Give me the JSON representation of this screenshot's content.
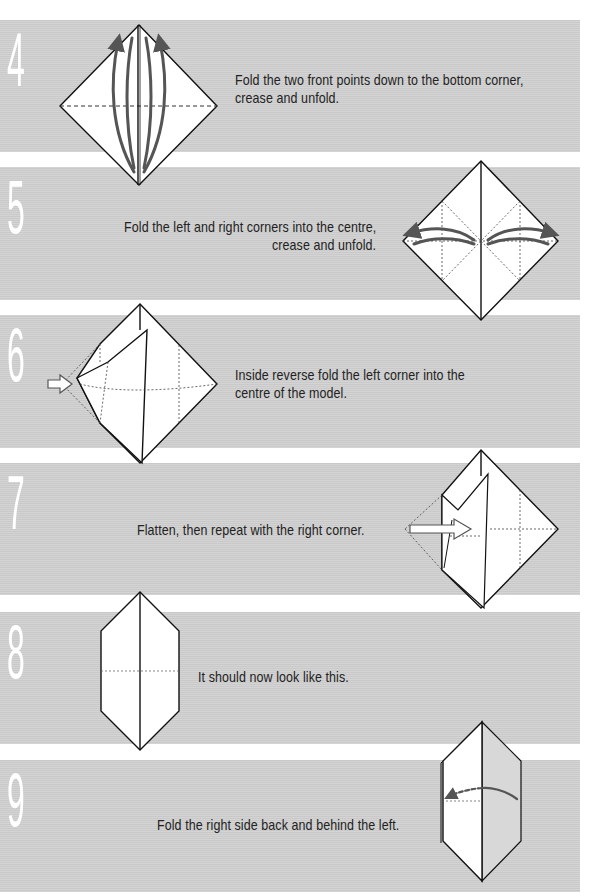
{
  "colors": {
    "band": "#cfcfcf",
    "numeral": "#ffffff",
    "text": "#222222",
    "arrow": "#555555",
    "paper": "#ffffff",
    "line": "#111111"
  },
  "steps": [
    {
      "number": "4",
      "text_lines": [
        "Fold the two front points down to the bottom corner,",
        "crease and unfold."
      ],
      "diagram": "square-base-diamond-with-curved-arrows"
    },
    {
      "number": "5",
      "text_lines": [
        "Fold the left and right corners into the centre,",
        "crease and unfold."
      ],
      "diagram": "diamond-with-side-corner-arrows"
    },
    {
      "number": "6",
      "text_lines": [
        "Inside reverse fold the left corner into the",
        "centre of the model."
      ],
      "diagram": "diamond-left-inside-reverse-fold"
    },
    {
      "number": "7",
      "text_lines": [
        "Flatten, then repeat with the right corner."
      ],
      "diagram": "diamond-right-inside-reverse-fold"
    },
    {
      "number": "8",
      "text_lines": [
        "It should now look like this."
      ],
      "diagram": "elongated-hexagon"
    },
    {
      "number": "9",
      "text_lines": [
        "Fold the right side back and behind  the left."
      ],
      "diagram": "hexagon-fold-behind-arrow"
    }
  ]
}
